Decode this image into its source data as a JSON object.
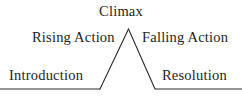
{
  "diagram": {
    "type": "freytag-pyramid",
    "background_color": "#ffffff",
    "line_color": "#2b2b2b",
    "text_color": "#242424",
    "labels": {
      "climax": "Climax",
      "rising_action": "Rising Action",
      "falling_action": "Falling Action",
      "introduction": "Introduction",
      "resolution": "Resolution"
    },
    "geometry": {
      "width": 242,
      "height": 96,
      "baseline_y": 89,
      "left_baseline": {
        "x1": 0,
        "y1": 89,
        "x2": 100,
        "y2": 89
      },
      "rising_line": {
        "x1": 100,
        "y1": 89,
        "x2": 128.5,
        "y2": 29
      },
      "falling_line": {
        "x1": 128.5,
        "y1": 29,
        "x2": 155,
        "y2": 89
      },
      "right_baseline": {
        "x1": 155,
        "y1": 89,
        "x2": 242,
        "y2": 89
      },
      "apex": {
        "x": 128.5,
        "y": 29
      },
      "stroke_width": 1.1
    }
  }
}
